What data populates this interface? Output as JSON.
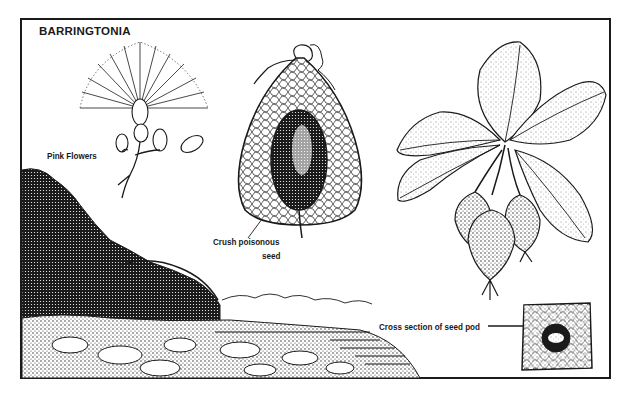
{
  "figure": {
    "title": "BARRINGTONIA",
    "colors": {
      "ink": "#1a1a1a",
      "paper": "#ffffff"
    },
    "labels": {
      "flowers": "Pink Flowers",
      "seed_line1": "Crush poisonous",
      "seed_line2": "seed",
      "cross_section": "Cross section of seed pod"
    },
    "elements": [
      "flower-cluster-illustration",
      "seed-pod-cutaway-illustration",
      "leaf-and-fruit-branch-illustration",
      "coastal-landscape-illustration",
      "seed-pod-cross-section-illustration"
    ]
  }
}
